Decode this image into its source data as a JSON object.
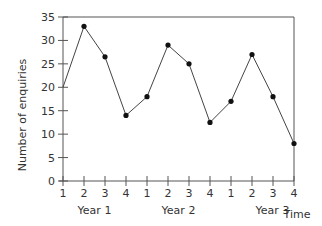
{
  "chart_data": {
    "type": "line",
    "title": "",
    "xlabel": "Time",
    "ylabel": "Number of enquiries",
    "ylim": [
      0,
      35
    ],
    "yticks": [
      0,
      5,
      10,
      15,
      20,
      25,
      30,
      35
    ],
    "x_tick_labels": [
      "1",
      "2",
      "3",
      "4",
      "1",
      "2",
      "3",
      "4",
      "1",
      "2",
      "3",
      "4"
    ],
    "year_labels": [
      "Year 1",
      "Year 2",
      "Year 3"
    ],
    "grid": false,
    "legend": null,
    "series": [
      {
        "name": "Enquiries",
        "values": [
          20,
          33,
          26.5,
          14,
          18,
          29,
          25,
          12.5,
          17,
          27,
          18,
          8
        ]
      }
    ]
  }
}
